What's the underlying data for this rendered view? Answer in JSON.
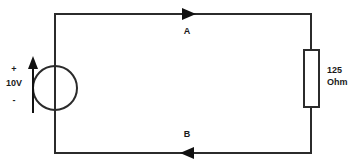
{
  "diagram": {
    "background_color": "#ffffff",
    "line_color": "#2b2b2b"
  },
  "source": {
    "type": "voltage-source",
    "plus_sign": "+",
    "minus_sign": "-",
    "value_label": "10V"
  },
  "resistor": {
    "type": "resistor",
    "value": "125",
    "unit": "Ohm"
  },
  "nodes": {
    "top": "A",
    "bottom": "B"
  },
  "current": {
    "top_direction": "right",
    "bottom_direction": "left"
  }
}
